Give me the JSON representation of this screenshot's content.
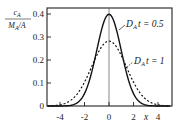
{
  "chart_data": {
    "type": "line",
    "title": "",
    "xlabel": "x",
    "ylabel": "c_A / (M_A / A)",
    "ylabel_parts": {
      "numerator": "c",
      "numerator_sub": "A",
      "denominator": "M",
      "denominator_sub": "A",
      "denominator_tail": "/A"
    },
    "xlim": [
      -5,
      5
    ],
    "ylim": [
      0,
      0.42
    ],
    "xticks": [
      -4,
      -2,
      0,
      2,
      4
    ],
    "xtick_labels": [
      "-4",
      "-2",
      "0",
      "2",
      "4"
    ],
    "yticks": [
      0,
      0.1,
      0.2,
      0.3,
      0.4
    ],
    "ytick_labels": [
      "0",
      "0.1",
      "0.2",
      "0.3",
      "0.4"
    ],
    "grid": false,
    "center_line_x": 0,
    "series": [
      {
        "name": "D_A t = 0.5",
        "label_parts": {
          "prefix": "D",
          "sub": "A",
          "suffix": "t = 0.5"
        },
        "style": "solid",
        "x": [
          -5,
          -4.5,
          -4,
          -3.5,
          -3,
          -2.5,
          -2,
          -1.5,
          -1,
          -0.5,
          0,
          0.5,
          1,
          1.5,
          2,
          2.5,
          3,
          3.5,
          4,
          4.5,
          5
        ],
        "values": [
          0.0,
          0.0,
          0.0001,
          0.0009,
          0.0044,
          0.0175,
          0.054,
          0.1295,
          0.242,
          0.3521,
          0.3989,
          0.3521,
          0.242,
          0.1295,
          0.054,
          0.0175,
          0.0044,
          0.0009,
          0.0001,
          0.0,
          0.0
        ]
      },
      {
        "name": "D_A t = 1",
        "label_parts": {
          "prefix": "D",
          "sub": "A",
          "suffix": "t = 1"
        },
        "style": "dashed",
        "x": [
          -5,
          -4.5,
          -4,
          -3.5,
          -3,
          -2.5,
          -2,
          -1.5,
          -1,
          -0.5,
          0,
          0.5,
          1,
          1.5,
          2,
          2.5,
          3,
          3.5,
          4,
          4.5,
          5
        ],
        "values": [
          0.0055,
          0.0143,
          0.0052,
          0.0132,
          0.0297,
          0.0591,
          0.1038,
          0.1607,
          0.2197,
          0.265,
          0.2821,
          0.265,
          0.2197,
          0.1607,
          0.1038,
          0.0591,
          0.0297,
          0.0132,
          0.0052,
          0.0143,
          0.0055
        ]
      }
    ],
    "legend_position": "inline annotations, upper right"
  }
}
